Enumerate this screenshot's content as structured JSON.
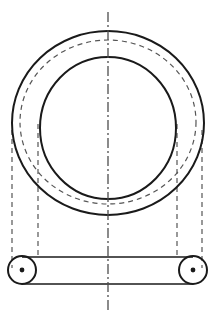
{
  "canvas": {
    "width": 214,
    "height": 327,
    "background": "#ffffff",
    "title": "Mechanical ring clamp orthographic view"
  },
  "style": {
    "solid_color": "#1a1a1a",
    "hidden_color": "#555555",
    "center_color": "#4d4d4d",
    "solid_width": 2.0,
    "thin_solid_width": 1.4,
    "hidden_width": 1.2,
    "center_width": 1.3,
    "hidden_dash": "5,4",
    "center_dash": "10,3,2,3"
  },
  "geometry": {
    "center_x": 108,
    "outer_ring": {
      "name": "outer-ring-outline",
      "cx": 108,
      "cy": 123,
      "rx": 96,
      "ry": 92,
      "line": "solid"
    },
    "hidden_ring": {
      "name": "hidden-bore-outline",
      "cx": 108,
      "cy": 122,
      "rx": 88,
      "ry": 82,
      "line": "hidden"
    },
    "inner_ring": {
      "name": "inner-bore-outline",
      "cx": 108,
      "cy": 128,
      "rx": 68,
      "ry": 71,
      "line": "solid"
    },
    "bar": {
      "name": "bottom-bar",
      "top_y": 257,
      "bottom_y": 284,
      "left_x": 22,
      "right_x": 193,
      "line": "solid"
    },
    "bosses": [
      {
        "name": "left-boss",
        "cx": 22,
        "cy": 270,
        "r": 14,
        "dot_r": 2.4,
        "line": "solid"
      },
      {
        "name": "right-boss",
        "cx": 193,
        "cy": 270,
        "r": 14,
        "dot_r": 2.4,
        "line": "solid"
      }
    ],
    "projection_lines": [
      {
        "name": "projection-line-outer-left",
        "x": 12,
        "y1": 130,
        "y2": 268
      },
      {
        "name": "projection-line-inner-left",
        "x": 38,
        "y1": 124,
        "y2": 258
      },
      {
        "name": "projection-line-inner-right",
        "x": 177,
        "y1": 124,
        "y2": 258
      },
      {
        "name": "projection-line-outer-right",
        "x": 202,
        "y1": 130,
        "y2": 268
      }
    ],
    "centerline": {
      "name": "vertical-centerline",
      "x": 108,
      "y1": 12,
      "y2": 312
    }
  }
}
